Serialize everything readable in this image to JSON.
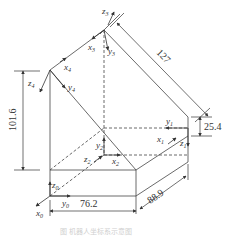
{
  "diagram": {
    "type": "isometric-coordinate-frame-diagram",
    "dimensions": {
      "height_total": "101.6",
      "slope_length": "127",
      "box_height": "25.4",
      "depth": "88.9",
      "width": "76.2"
    },
    "frames": [
      {
        "id": "0",
        "axes": [
          "x0",
          "y0",
          "z0"
        ]
      },
      {
        "id": "1",
        "axes": [
          "x1",
          "y1",
          "z1"
        ]
      },
      {
        "id": "2",
        "axes": [
          "x2",
          "y2",
          "z2"
        ]
      },
      {
        "id": "3",
        "axes": [
          "x3",
          "y3",
          "z3"
        ]
      },
      {
        "id": "4",
        "axes": [
          "x4",
          "y4",
          "z4"
        ]
      }
    ],
    "labels": {
      "z3": {
        "base": "z",
        "sub": "3"
      },
      "x3": {
        "base": "x",
        "sub": "3"
      },
      "y3": {
        "base": "y",
        "sub": "3"
      },
      "x4": {
        "base": "x",
        "sub": "4"
      },
      "z4": {
        "base": "z",
        "sub": "4"
      },
      "y4": {
        "base": "y",
        "sub": "4"
      },
      "y1": {
        "base": "y",
        "sub": "1"
      },
      "x1": {
        "base": "x",
        "sub": "1"
      },
      "z1": {
        "base": "z",
        "sub": "1"
      },
      "y2": {
        "base": "y",
        "sub": "2"
      },
      "z2": {
        "base": "z",
        "sub": "2"
      },
      "x2": {
        "base": "x",
        "sub": "2"
      },
      "z0": {
        "base": "z",
        "sub": "0"
      },
      "y0": {
        "base": "y",
        "sub": "0"
      },
      "x0": {
        "base": "x",
        "sub": "0"
      }
    },
    "caption": "图 机器人坐标系示意图"
  }
}
